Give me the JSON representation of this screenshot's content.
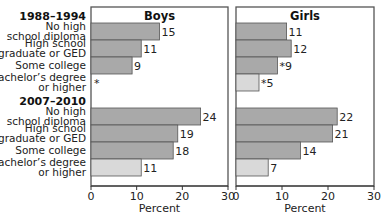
{
  "chart_data": {
    "type": "bar",
    "orientation": "horizontal",
    "xlabel": "Percent",
    "xlim": [
      0,
      30
    ],
    "xticks": [
      "0",
      "10",
      "20",
      "30"
    ],
    "groups": [
      {
        "label": "1988–1994",
        "categories": [
          {
            "line1": "No high",
            "line2": "school diploma"
          },
          {
            "line1": "High school",
            "line2": "graduate or GED"
          },
          {
            "line1": "Some college",
            "line2": ""
          },
          {
            "line1": "Bachelor’s degree",
            "line2": "or higher"
          }
        ]
      },
      {
        "label": "2007–2010",
        "categories": [
          {
            "line1": "No high",
            "line2": "school diploma"
          },
          {
            "line1": "High school",
            "line2": "graduate or GED"
          },
          {
            "line1": "Some college",
            "line2": ""
          },
          {
            "line1": "Bachelor’s degree",
            "line2": "or higher"
          }
        ]
      }
    ],
    "panels": [
      {
        "title": "Boys",
        "series": [
          {
            "group": "1988–1994",
            "values": [
              15,
              11,
              9,
              null
            ],
            "labels": [
              "15",
              "11",
              "9",
              "*"
            ]
          },
          {
            "group": "2007–2010",
            "values": [
              24,
              19,
              18,
              11
            ],
            "labels": [
              "24",
              "19",
              "18",
              "11"
            ]
          }
        ]
      },
      {
        "title": "Girls",
        "series": [
          {
            "group": "1988–1994",
            "values": [
              11,
              12,
              9,
              5
            ],
            "labels": [
              "11",
              "12",
              "*9",
              "*5"
            ]
          },
          {
            "group": "2007–2010",
            "values": [
              22,
              21,
              14,
              7
            ],
            "labels": [
              "22",
              "21",
              "14",
              "7"
            ]
          }
        ]
      }
    ],
    "colors": {
      "dark_bar": "#a9a9a9",
      "light_bar": "#d9d9d9",
      "frame": "#555555"
    }
  }
}
